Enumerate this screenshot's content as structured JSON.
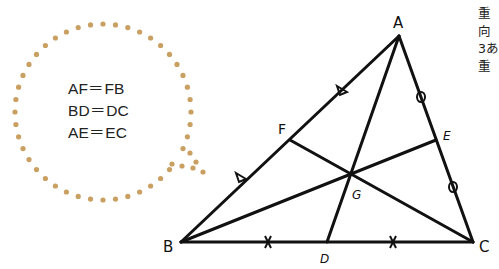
{
  "bubble": {
    "lines": [
      "AF＝FB",
      "BD＝DC",
      "AE＝EC"
    ],
    "dot_color": "#c9a062"
  },
  "triangle": {
    "vertices": {
      "A": "A",
      "B": "B",
      "C": "C"
    },
    "midpoints": {
      "D": "D",
      "E": "E",
      "F": "F"
    },
    "centroid": "G",
    "line_color": "#111111"
  },
  "side_text": {
    "lines": [
      "重",
      "向",
      "3あ",
      "重"
    ]
  }
}
